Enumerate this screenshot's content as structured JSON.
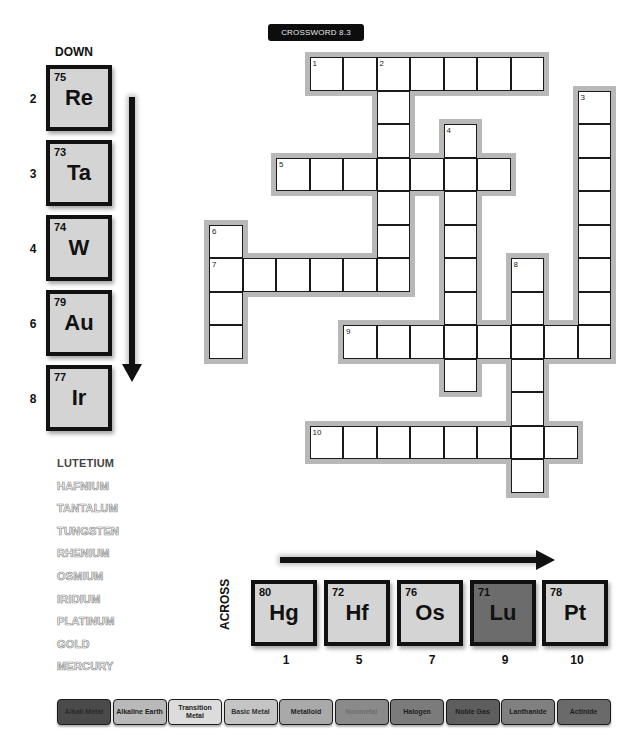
{
  "title": "CROSSWORD 8.3",
  "down": {
    "label": "DOWN",
    "tiles": [
      {
        "clue": "2",
        "number": "75",
        "symbol": "Re"
      },
      {
        "clue": "3",
        "number": "73",
        "symbol": "Ta"
      },
      {
        "clue": "4",
        "number": "74",
        "symbol": "W"
      },
      {
        "clue": "6",
        "number": "79",
        "symbol": "Au"
      },
      {
        "clue": "8",
        "number": "77",
        "symbol": "Ir"
      }
    ]
  },
  "across": {
    "label": "ACROSS",
    "tiles": [
      {
        "clue": "1",
        "number": "80",
        "symbol": "Hg"
      },
      {
        "clue": "5",
        "number": "72",
        "symbol": "Hf"
      },
      {
        "clue": "7",
        "number": "76",
        "symbol": "Os"
      },
      {
        "clue": "9",
        "number": "71",
        "symbol": "Lu"
      },
      {
        "clue": "10",
        "number": "78",
        "symbol": "Pt"
      }
    ]
  },
  "word_bank": [
    {
      "word": "LUTETIUM",
      "style": "solid"
    },
    {
      "word": "HAFNIUM",
      "style": "outline"
    },
    {
      "word": "TANTALUM",
      "style": "outline"
    },
    {
      "word": "TUNGSTEN",
      "style": "outline"
    },
    {
      "word": "RHENIUM",
      "style": "outline"
    },
    {
      "word": "OSMIUM",
      "style": "outline"
    },
    {
      "word": "IRIDIUM",
      "style": "outline"
    },
    {
      "word": "PLATINUM",
      "style": "outline"
    },
    {
      "word": "GOLD",
      "style": "outline"
    },
    {
      "word": "MERCURY",
      "style": "outline"
    }
  ],
  "grid": {
    "origin_x": 209,
    "origin_y": 57,
    "cell": 33.5,
    "entries": [
      {
        "num": "1",
        "dir": "across",
        "row": 0,
        "col": 3,
        "len": 7
      },
      {
        "num": "2",
        "dir": "down",
        "row": 0,
        "col": 5,
        "len": 7
      },
      {
        "num": "3",
        "dir": "down",
        "row": 1,
        "col": 11,
        "len": 8
      },
      {
        "num": "4",
        "dir": "down",
        "row": 2,
        "col": 7,
        "len": 8
      },
      {
        "num": "5",
        "dir": "across",
        "row": 3,
        "col": 2,
        "len": 7
      },
      {
        "num": "6",
        "dir": "down",
        "row": 5,
        "col": 0,
        "len": 4
      },
      {
        "num": "7",
        "dir": "across",
        "row": 6,
        "col": 0,
        "len": 6
      },
      {
        "num": "8",
        "dir": "down",
        "row": 6,
        "col": 9,
        "len": 7
      },
      {
        "num": "9",
        "dir": "across",
        "row": 8,
        "col": 4,
        "len": 8
      },
      {
        "num": "10",
        "dir": "across",
        "row": 11,
        "col": 3,
        "len": 8
      }
    ]
  },
  "legend": [
    {
      "label": "Alkali Metal",
      "bg": "#4a4a4a",
      "fg": "#2a2a2a"
    },
    {
      "label": "Alkaline Earth",
      "bg": "#b9b9b9",
      "fg": "#222222"
    },
    {
      "label": "Transition Metal",
      "bg": "#dcdcdc",
      "fg": "#222222"
    },
    {
      "label": "Basic Metal",
      "bg": "#c4c4c4",
      "fg": "#333333"
    },
    {
      "label": "Metalloid",
      "bg": "#a9a9a9",
      "fg": "#222222"
    },
    {
      "label": "Nonmetal",
      "bg": "#8a8a8a",
      "fg": "#6e6e6e"
    },
    {
      "label": "Halogen",
      "bg": "#7b7b7b",
      "fg": "#1e1e1e"
    },
    {
      "label": "Noble Gas",
      "bg": "#5e5e5e",
      "fg": "#1e1e1e"
    },
    {
      "label": "Lanthanide",
      "bg": "#808080",
      "fg": "#1e1e1e"
    },
    {
      "label": "Actinide",
      "bg": "#6a6a6a",
      "fg": "#1e1e1e"
    }
  ],
  "colors": {
    "tile_default": "#d4d4d4",
    "tile_lanthanide": "#6c6c6c"
  }
}
